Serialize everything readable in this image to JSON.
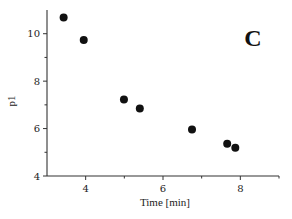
{
  "chart_data": {
    "type": "scatter",
    "title": "",
    "panel_label": "C",
    "xlabel": "Time [min]",
    "ylabel": "p1",
    "xlim": [
      3,
      9
    ],
    "ylim": [
      4,
      11
    ],
    "x_ticks_major": [
      4,
      6,
      8
    ],
    "x_ticks_minor": [
      5,
      7,
      9
    ],
    "y_ticks_major": [
      4,
      6,
      8,
      10
    ],
    "y_ticks_minor": [
      5,
      7,
      9
    ],
    "grid": false,
    "legend": null,
    "series": [
      {
        "name": "p1",
        "marker": "filled-circle",
        "color": "#111111",
        "x": [
          3.43,
          3.95,
          4.99,
          5.4,
          6.75,
          7.66,
          7.87
        ],
        "y": [
          10.68,
          9.74,
          7.23,
          6.85,
          5.96,
          5.36,
          5.19
        ]
      }
    ]
  }
}
